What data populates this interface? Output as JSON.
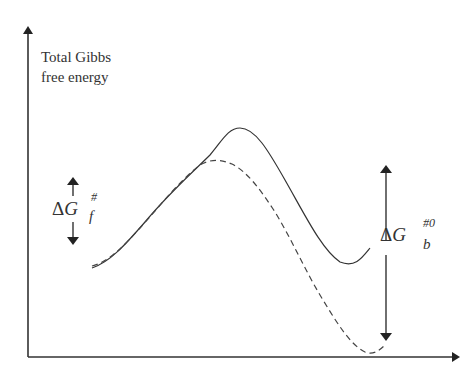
{
  "diagram": {
    "type": "energy-profile",
    "y_axis_label_line1": "Total Gibbs",
    "y_axis_label_line2": "free energy",
    "forward_barrier": {
      "delta": "Δ",
      "symbol": "G",
      "superscript": "#",
      "subscript": "f"
    },
    "backward_barrier": {
      "delta": "Δ",
      "symbol": "G",
      "superscript": "#0",
      "subscript": "b"
    },
    "curves": [
      {
        "name": "solid-curve",
        "style": "solid",
        "description": "higher barrier, shallower final minimum"
      },
      {
        "name": "dashed-curve",
        "style": "dashed",
        "description": "lower barrier, deeper final minimum"
      }
    ],
    "colors": {
      "axis": "#333333",
      "curve": "#444444",
      "text": "#333333"
    }
  }
}
